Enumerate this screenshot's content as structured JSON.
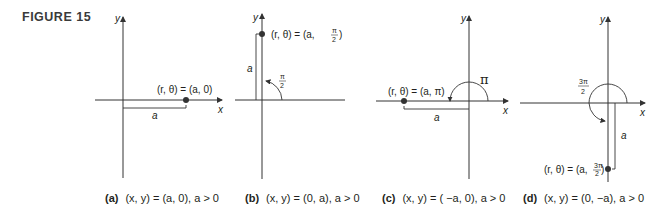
{
  "figure": {
    "label": "FIGURE 15"
  },
  "panels": [
    {
      "id": "a",
      "point_label": "(r, θ) = (a, 0)",
      "angle_label": "",
      "distance_label": "a",
      "x_axis_label": "x",
      "y_axis_label": "y",
      "caption_tag": "(a)",
      "caption_text": "(x, y) = (a, 0), a > 0"
    },
    {
      "id": "b",
      "point_label": "(r, θ) = (a, π/2)",
      "angle_label": "π/2",
      "distance_label": "a",
      "x_axis_label": "x",
      "y_axis_label": "y",
      "caption_tag": "(b)",
      "caption_text": "(x, y) = (0, a), a > 0"
    },
    {
      "id": "c",
      "point_label": "(r, θ) = (a, π)",
      "angle_label": "π",
      "distance_label": "a",
      "x_axis_label": "x",
      "y_axis_label": "y",
      "caption_tag": "(c)",
      "caption_text": "(x, y) = ( −a, 0), a > 0"
    },
    {
      "id": "d",
      "point_label": "(r, θ) = (a, 3π/2)",
      "angle_label": "3π/2",
      "distance_label": "a",
      "x_axis_label": "x",
      "y_axis_label": "y",
      "caption_tag": "(d)",
      "caption_text": "(x, y) = (0, −a), a > 0"
    }
  ],
  "text": {
    "a_point": "(r, θ) = (a, 0)",
    "b_point_prefix": "(r, θ) = (a,",
    "c_point": "(r, θ) = (a, π)",
    "d_point_prefix": "(r, θ) = (a,",
    "pi": "π",
    "three_pi": "3π",
    "two": "2",
    "a": "a",
    "x": "x",
    "y": "y",
    "close_paren": ")"
  }
}
